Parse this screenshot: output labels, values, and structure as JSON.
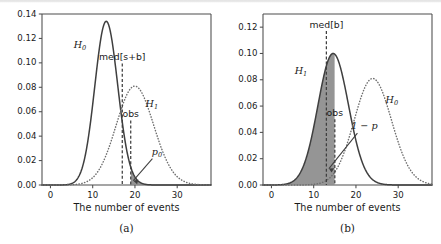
{
  "figure": {
    "background": "#ffffff",
    "ink": "#1a1a1a",
    "solid_curve_color": "#3f3f3f",
    "dotted_curve_color": "#6e6e6e",
    "shade_color": "#8c8c8c"
  },
  "chart_data": [
    {
      "type": "line",
      "panel": "a",
      "caption": "(a)",
      "title": "",
      "xlabel": "The number of events",
      "ylabel": "",
      "xlim": [
        -2,
        38
      ],
      "ylim": [
        0.0,
        0.14
      ],
      "xticks": [
        0,
        10,
        20,
        30
      ],
      "xticklabels": [
        "0",
        "10",
        "20",
        "30"
      ],
      "yticks": [
        0.0,
        0.02,
        0.04,
        0.06,
        0.08,
        0.1,
        0.12,
        0.14
      ],
      "yticklabels": [
        "0.00",
        "0.02",
        "0.04",
        "0.06",
        "0.08",
        "0.10",
        "0.12",
        "0.14"
      ],
      "grid": false,
      "legend": "none",
      "series": [
        {
          "name": "H_0",
          "style": "solid",
          "label": "H",
          "label_sub": "0",
          "label_x": 7.0,
          "label_y": 0.112,
          "distribution": "poisson-like",
          "mean": 12.0,
          "peak_x": 12.0,
          "peak_y": 0.134,
          "sigma": 3.0
        },
        {
          "name": "H_1",
          "style": "dotted",
          "label": "H",
          "label_sub": "1",
          "label_x": 24.0,
          "label_y": 0.064,
          "distribution": "poisson-like",
          "mean": 18.0,
          "peak_x": 18.0,
          "peak_y": 0.081,
          "sigma": 4.9
        }
      ],
      "markers": [
        {
          "name": "med[s+b]",
          "label": "med[s+b]",
          "x": 17.0,
          "style": "dashed-vline",
          "label_y": 0.102
        },
        {
          "name": "obs",
          "label": "obs",
          "x": 19.0,
          "style": "dashed-vline",
          "label_y": 0.0555
        }
      ],
      "shaded_regions": [
        {
          "name": "p0-tail",
          "label": "p",
          "label_sub": "0",
          "series": "H_0",
          "from_x": 19.0,
          "to_x": 38.0,
          "label_x": 25.2,
          "label_y": 0.0245
        }
      ]
    },
    {
      "type": "line",
      "panel": "b",
      "caption": "(b)",
      "title": "",
      "xlabel": "The number of events",
      "ylabel": "",
      "xlim": [
        -2,
        38
      ],
      "ylim": [
        0.0,
        0.13
      ],
      "xticks": [
        0,
        10,
        20,
        30
      ],
      "xticklabels": [
        "0",
        "10",
        "20",
        "30"
      ],
      "yticks": [
        0.0,
        0.02,
        0.04,
        0.06,
        0.08,
        0.1,
        0.12
      ],
      "yticklabels": [
        "0.00",
        "0.02",
        "0.04",
        "0.06",
        "0.08",
        "0.10",
        "0.12"
      ],
      "grid": false,
      "legend": "none",
      "series": [
        {
          "name": "H_1",
          "style": "solid",
          "label": "H",
          "label_sub": "1",
          "label_x": 7.0,
          "label_y": 0.0845,
          "distribution": "poisson-like",
          "mean": 13.0,
          "peak_x": 13.0,
          "peak_y": 0.1,
          "sigma": 4.0
        },
        {
          "name": "H_0",
          "style": "dotted",
          "label": "H",
          "label_sub": "0",
          "label_x": 28.5,
          "label_y": 0.0625,
          "distribution": "poisson-like",
          "mean": 22.0,
          "peak_x": 22.0,
          "peak_y": 0.081,
          "sigma": 4.9
        }
      ],
      "markers": [
        {
          "name": "med[b]",
          "label": "med[b]",
          "x": 13.0,
          "style": "dashed-vline",
          "label_y": 0.1195
        },
        {
          "name": "obs",
          "label": "obs",
          "x": 15.0,
          "style": "dashed-vline",
          "label_y": 0.0525
        }
      ],
      "shaded_regions": [
        {
          "name": "one-minus-p-region",
          "label": "1 − p",
          "series": "H_1",
          "from_x": -2.0,
          "to_x": 15.0,
          "label_x": 22.0,
          "label_y": 0.0425
        }
      ]
    }
  ]
}
